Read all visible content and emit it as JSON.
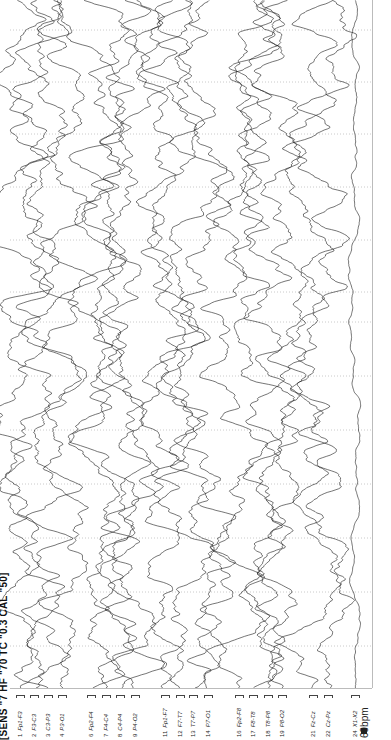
{
  "header": {
    "settings_text": "[SENS \"7  HF \"70  TC \"0.3  CAL \"50]"
  },
  "channels": [
    {
      "num": "1",
      "label": "Fp1-F3",
      "x": 20,
      "amp": 9,
      "noise": 0.9
    },
    {
      "num": "2",
      "label": "F3-C3",
      "x": 34,
      "amp": 9,
      "noise": 0.9
    },
    {
      "num": "3",
      "label": "C3-P3",
      "x": 48,
      "amp": 9,
      "noise": 0.9
    },
    {
      "num": "4",
      "label": "P3-O1",
      "x": 62,
      "amp": 9,
      "noise": 0.9
    },
    {
      "num": "6",
      "label": "Fp2-F4",
      "x": 91,
      "amp": 9,
      "noise": 0.9
    },
    {
      "num": "7",
      "label": "F4-C4",
      "x": 106,
      "amp": 9,
      "noise": 0.9
    },
    {
      "num": "8",
      "label": "C4-P4",
      "x": 120,
      "amp": 9,
      "noise": 0.9
    },
    {
      "num": "9",
      "label": "P4-O2",
      "x": 135,
      "amp": 9,
      "noise": 0.9
    },
    {
      "num": "11",
      "label": "Fp1-F7",
      "x": 165,
      "amp": 9,
      "noise": 0.9
    },
    {
      "num": "12",
      "label": "F7-T7",
      "x": 180,
      "amp": 9,
      "noise": 0.9
    },
    {
      "num": "13",
      "label": "T7-P7",
      "x": 193,
      "amp": 9,
      "noise": 0.9
    },
    {
      "num": "14",
      "label": "P7-O1",
      "x": 208,
      "amp": 9,
      "noise": 0.9
    },
    {
      "num": "16",
      "label": "Fp2-F8",
      "x": 239,
      "amp": 9,
      "noise": 0.9
    },
    {
      "num": "17",
      "label": "F8-T8",
      "x": 253,
      "amp": 9,
      "noise": 0.9
    },
    {
      "num": "18",
      "label": "T8-P8",
      "x": 268,
      "amp": 9,
      "noise": 0.9
    },
    {
      "num": "19",
      "label": "P8-O2",
      "x": 282,
      "amp": 9,
      "noise": 0.9
    },
    {
      "num": "21",
      "label": "Fz-Cz",
      "x": 313,
      "amp": 9,
      "noise": 0.9
    },
    {
      "num": "22",
      "label": "Cz-Pz",
      "x": 328,
      "amp": 9,
      "noise": 0.9
    },
    {
      "num": "24",
      "label": "X1-X2",
      "x": 355,
      "amp": 4,
      "noise": 0.35
    }
  ],
  "ecg": {
    "heart_rate": "69bpm",
    "marker": "M"
  },
  "grid": {
    "second_marks_y": [
      30,
      82,
      134,
      187,
      240,
      292,
      322,
      376,
      430,
      484,
      538,
      592,
      646
    ],
    "trace_area": {
      "x0": 10,
      "x1": 372,
      "y0": 0,
      "y1": 688
    }
  },
  "colors": {
    "trace": "#1a1a1a",
    "grid": "#bdbdbd",
    "background": "#ffffff"
  }
}
